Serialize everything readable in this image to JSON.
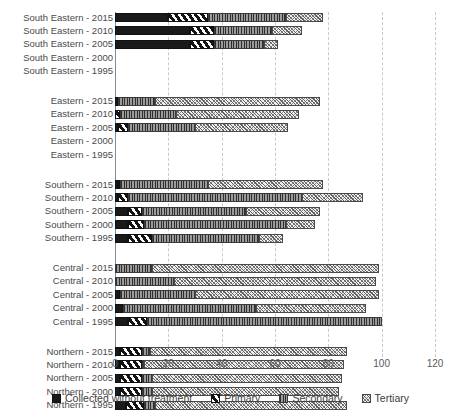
{
  "chart_data": {
    "type": "bar",
    "orientation": "horizontal",
    "stacked": true,
    "title": "",
    "xlabel": "",
    "ylabel": "",
    "xlim": [
      0,
      120
    ],
    "xticks": [
      0,
      20,
      40,
      60,
      80,
      100,
      120
    ],
    "xticklabels": [
      "0",
      "20",
      "40",
      "60",
      "80",
      "100",
      "120"
    ],
    "grid": "vertical-dashed",
    "legend_position": "bottom",
    "series": [
      {
        "name": "Collected without treatment",
        "pattern": "solid-black"
      },
      {
        "name": "Primary",
        "pattern": "diagonal-stripe"
      },
      {
        "name": "Secondary",
        "pattern": "vertical-line"
      },
      {
        "name": "Tertiary",
        "pattern": "cross-hatch"
      }
    ],
    "categories": [
      "South Eastern - 2015",
      "South Eastern - 2010",
      "South Eastern - 2005",
      "South Eastern - 2000",
      "South Eastern - 1995",
      "Eastern - 2015",
      "Eastern - 2010",
      "Eastern - 2005",
      "Eastern - 2000",
      "Eastern - 1995",
      "Southern - 2015",
      "Southern - 2010",
      "Southern - 2005",
      "Southern - 2000",
      "Southern - 1995",
      "Central - 2015",
      "Central - 2010",
      "Central - 2005",
      "Central - 2000",
      "Central - 1995",
      "Northern - 2015",
      "Northern - 2010",
      "Northern - 2005",
      "Northern - 2000",
      "Northern - 1995"
    ],
    "rows": [
      {
        "label": "South Eastern - 2015",
        "group": "South Eastern",
        "year": "2015",
        "values": [
          20,
          15,
          29,
          14
        ],
        "total": 78
      },
      {
        "label": "South Eastern - 2010",
        "group": "South Eastern",
        "year": "2010",
        "values": [
          28,
          9,
          22,
          11
        ],
        "total": 70
      },
      {
        "label": "South Eastern - 2005",
        "group": "South Eastern",
        "year": "2005",
        "values": [
          28,
          9,
          19,
          5
        ],
        "total": 61
      },
      {
        "label": "South Eastern - 2000",
        "group": "South Eastern",
        "year": "2000",
        "values": [
          0,
          0,
          0,
          0
        ],
        "total": 0
      },
      {
        "label": "South Eastern - 1995",
        "group": "South Eastern",
        "year": "1995",
        "values": [
          0,
          0,
          0,
          0
        ],
        "total": 0
      },
      {
        "label": "Eastern - 2015",
        "group": "Eastern",
        "year": "2015",
        "values": [
          1,
          0,
          14,
          62
        ],
        "total": 77
      },
      {
        "label": "Eastern - 2010",
        "group": "Eastern",
        "year": "2010",
        "values": [
          0,
          2,
          21,
          46
        ],
        "total": 69
      },
      {
        "label": "Eastern - 2005",
        "group": "Eastern",
        "year": "2005",
        "values": [
          1,
          4,
          25,
          35
        ],
        "total": 65
      },
      {
        "label": "Eastern - 2000",
        "group": "Eastern",
        "year": "2000",
        "values": [
          0,
          0,
          0,
          0
        ],
        "total": 0
      },
      {
        "label": "Eastern - 1995",
        "group": "Eastern",
        "year": "1995",
        "values": [
          0,
          0,
          0,
          0
        ],
        "total": 0
      },
      {
        "label": "Southern - 2015",
        "group": "Southern",
        "year": "2015",
        "values": [
          1,
          1,
          33,
          43
        ],
        "total": 78
      },
      {
        "label": "Southern - 2010",
        "group": "Southern",
        "year": "2010",
        "values": [
          1,
          4,
          65,
          23
        ],
        "total": 93
      },
      {
        "label": "Southern - 2005",
        "group": "Southern",
        "year": "2005",
        "values": [
          5,
          5,
          39,
          28
        ],
        "total": 77
      },
      {
        "label": "Southern - 2000",
        "group": "Southern",
        "year": "2000",
        "values": [
          5,
          6,
          53,
          11
        ],
        "total": 75
      },
      {
        "label": "Southern - 1995",
        "group": "Southern",
        "year": "1995",
        "values": [
          5,
          9,
          40,
          9
        ],
        "total": 63
      },
      {
        "label": "Central - 2015",
        "group": "Central",
        "year": "2015",
        "values": [
          0,
          0,
          14,
          85
        ],
        "total": 99
      },
      {
        "label": "Central - 2010",
        "group": "Central",
        "year": "2010",
        "values": [
          0,
          0,
          22,
          76
        ],
        "total": 98
      },
      {
        "label": "Central - 2005",
        "group": "Central",
        "year": "2005",
        "values": [
          2,
          0,
          28,
          69
        ],
        "total": 99
      },
      {
        "label": "Central - 2000",
        "group": "Central",
        "year": "2000",
        "values": [
          3,
          0,
          50,
          41
        ],
        "total": 94
      },
      {
        "label": "Central - 1995",
        "group": "Central",
        "year": "1995",
        "values": [
          5,
          7,
          88,
          0
        ],
        "total": 97
      },
      {
        "label": "Northern - 2015",
        "group": "Northern",
        "year": "2015",
        "values": [
          2,
          8,
          3,
          74
        ],
        "total": 87
      },
      {
        "label": "Northern - 2010",
        "group": "Northern",
        "year": "2010",
        "values": [
          2,
          8,
          1,
          75
        ],
        "total": 86
      },
      {
        "label": "Northern - 2005",
        "group": "Northern",
        "year": "2005",
        "values": [
          2,
          8,
          4,
          71
        ],
        "total": 85
      },
      {
        "label": "Northern - 2000",
        "group": "Northern",
        "year": "2000",
        "values": [
          2,
          8,
          4,
          70
        ],
        "total": 84
      },
      {
        "label": "Northern - 1995",
        "group": "Northern",
        "year": "1995",
        "values": [
          4,
          7,
          4,
          72
        ],
        "total": 87
      }
    ]
  },
  "legend": {
    "items": [
      {
        "label": "Collected without treatment",
        "key": "collected-without-treatment"
      },
      {
        "label": "Primary",
        "key": "primary"
      },
      {
        "label": "Secondary",
        "key": "secondary"
      },
      {
        "label": "Tertiary",
        "key": "tertiary"
      }
    ]
  },
  "colors": {
    "black": "#1a1a1a",
    "grid": "#c9c9c9",
    "axis": "#8a8a8a",
    "text": "#4a4a4a"
  }
}
